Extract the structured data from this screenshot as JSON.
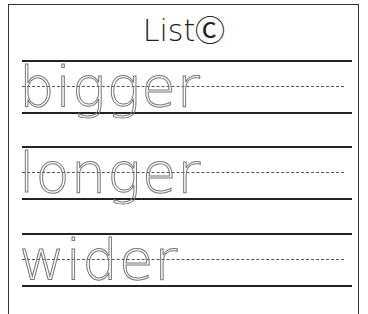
{
  "worksheet": {
    "title": "ListⒸ",
    "rows": [
      {
        "word": "bigger"
      },
      {
        "word": "longer"
      },
      {
        "word": "wider"
      }
    ]
  }
}
